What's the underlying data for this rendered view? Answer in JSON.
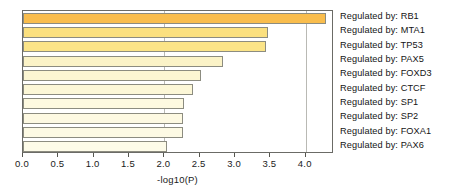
{
  "chart_data": {
    "type": "bar",
    "orientation": "horizontal",
    "title": "",
    "subtitle": "",
    "xlabel": "-log10(P)",
    "ylabel": "",
    "xlim": [
      0.0,
      4.4
    ],
    "xticks": [
      "0.0",
      "0.5",
      "1.0",
      "1.5",
      "2.0",
      "2.5",
      "3.0",
      "3.5",
      "4.0"
    ],
    "xtick_values": [
      0.0,
      0.5,
      1.0,
      1.5,
      2.0,
      2.5,
      3.0,
      3.5,
      4.0
    ],
    "grid": "vertical gridlines at 2.0 and 4.0",
    "gridline_values": [
      2.0,
      4.0
    ],
    "legend_position": "right-outside-labels",
    "categories": [
      "Regulated by: RB1",
      "Regulated by: MTA1",
      "Regulated by: TP53",
      "Regulated by: PAX5",
      "Regulated by: FOXD3",
      "Regulated by: CTCF",
      "Regulated by: SP1",
      "Regulated by: SP2",
      "Regulated by: FOXA1",
      "Regulated by: PAX6"
    ],
    "values": [
      4.28,
      3.47,
      3.44,
      2.83,
      2.52,
      2.4,
      2.28,
      2.27,
      2.26,
      2.04
    ],
    "bar_colors": [
      "#f9bd4d",
      "#fbe07f",
      "#fbe488",
      "#fbf3c7",
      "#fcf6d2",
      "#fcf7d7",
      "#fdf9e0",
      "#fdf9e2",
      "#fdfae4",
      "#fdfbe8"
    ],
    "bar_border_color": "#8c8c80",
    "frame_color": "#6b6b66",
    "gridline_color": "#b9b9b4"
  }
}
